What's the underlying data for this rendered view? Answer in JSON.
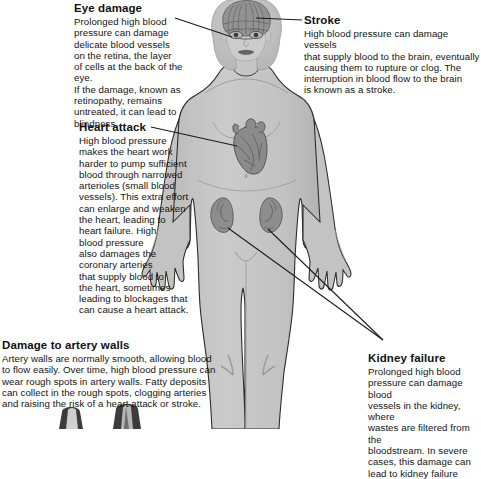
{
  "diagram": {
    "figure_alt": "front-facing female human body silhouette with brain, heart and kidneys highlighted"
  },
  "callouts": {
    "eye_damage": {
      "title": "Eye damage",
      "body": "Prolonged high blood\npressure can damage\ndelicate blood vessels\non the retina, the layer\nof cells at the back of the eye.\nIf the damage, known as\nretinopathy, remains\nuntreated, it can lead to\nblindness."
    },
    "stroke": {
      "title": "Stroke",
      "body": "High blood pressure can damage vessels\nthat supply blood to the brain, eventually\ncausing them to rupture or clog. The\ninterruption in blood flow to the brain\nis known as a stroke."
    },
    "heart_attack": {
      "title": "Heart attack",
      "body": "High blood pressure\nmakes the heart work\nharder to pump sufficient\nblood through narrowed\narterioles (small blood\nvessels). This extra effort\ncan enlarge and weaken\nthe heart, leading to\nheart failure. High\nblood pressure\nalso damages the\ncoronary arteries\nthat supply blood to\nthe heart, sometimes\nleading to blockages that\ncan cause a heart attack."
    },
    "artery_walls": {
      "title": "Damage to artery walls",
      "body": "Artery walls are normally smooth, allowing blood\nto flow easily. Over time, high blood pressure can\nwear rough spots in artery walls. Fatty deposits\ncan collect in the rough spots, clogging arteries\nand raising the risk of a heart attack or stroke."
    },
    "kidney_failure": {
      "title": "Kidney failure",
      "body": "Prolonged high blood\npressure can damage blood\nvessels in the kidney, where\nwastes are filtered from the\nbloodstream. In severe\ncases, this damage can\nlead to kidney failure"
    }
  },
  "organs": {
    "brain_label": "brain",
    "eyes_label": "eyes",
    "heart_label": "heart",
    "kidney_left_label": "left kidney",
    "kidney_right_label": "right kidney",
    "artery_cross_section_label": "artery cross-section"
  },
  "colors": {
    "body_fill": "#c9c9c9",
    "body_outline": "#2b2b2b",
    "organ_fill": "#8e8e8e",
    "organ_dark": "#6e6e6e",
    "leader_line": "#1a1a1a",
    "text": "#141414",
    "background": "#ffffff"
  }
}
